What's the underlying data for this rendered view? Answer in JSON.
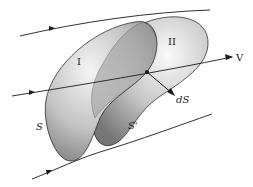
{
  "diagram": {
    "type": "streamtube-surfaces",
    "labels": {
      "region_1": "I",
      "region_2": "II",
      "surface_s": "S",
      "surface_s_prime": "S'",
      "vector_v": "V",
      "vector_ds": "dS"
    },
    "colors": {
      "line": "#1a1a1a",
      "surface_light": "#f2f2f2",
      "surface_mid": "#b8b8b8",
      "surface_dark": "#6e6e6e"
    }
  }
}
